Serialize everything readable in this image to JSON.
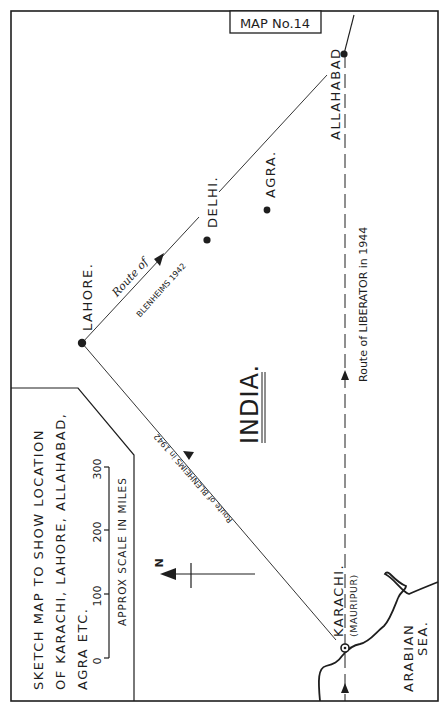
{
  "map": {
    "title": "MAP No.14",
    "region_label": "INDIA.",
    "sea_label_line1": "ARABIAN",
    "sea_label_line2": "SEA.",
    "north_label": "N",
    "colors": {
      "ink": "#1e1e1e",
      "paper": "#ffffff"
    }
  },
  "cities": [
    {
      "name": "ALLAHABAD",
      "x": 344,
      "y": 54
    },
    {
      "name": "DELHI.",
      "x": 207,
      "y": 240
    },
    {
      "name": "AGRA.",
      "x": 267,
      "y": 210
    },
    {
      "name": "LAHORE.",
      "x": 82,
      "y": 343
    },
    {
      "name": "KARACHI.",
      "sublabel": "(MAURIPUR)",
      "x": 345,
      "y": 648
    }
  ],
  "routes": {
    "blenheims_out": {
      "line1": "Route of",
      "line2": "BLENHEIMS 1942"
    },
    "blenheims_in": {
      "label": "Route of BLENHEIMS in 1942"
    },
    "liberator": {
      "label": "Route of LIBERATOR in 1944"
    }
  },
  "legend": {
    "line1": "SKETCH  MAP  TO  SHOW  LOCATION",
    "line2": "OF KARACHI, LAHORE, ALLAHABAD,",
    "line3": "AGRA  ETC.",
    "scale_ticks": [
      "0",
      "100",
      "200",
      "300"
    ],
    "scale_caption": "APPROX  SCALE  IN  MILES"
  }
}
